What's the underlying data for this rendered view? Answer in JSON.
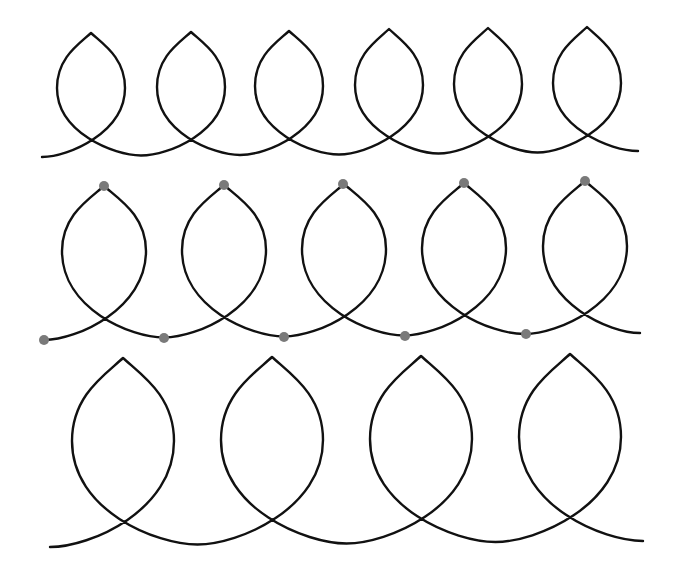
{
  "figure": {
    "stroke_color": "#111111",
    "dot_color": "#7a7a7a",
    "background": "#ffffff"
  },
  "rows": [
    {
      "id": "row-1",
      "start": [
        42,
        157
      ],
      "end": [
        638,
        151
      ],
      "loops": [
        {
          "cx": 91,
          "cusp_y": 33,
          "cross_y": 140,
          "wide_y": 88,
          "half_w": 34,
          "valley_y": 156
        },
        {
          "cx": 191,
          "cusp_y": 32,
          "cross_y": 140,
          "wide_y": 87,
          "half_w": 34,
          "valley_y": 155
        },
        {
          "cx": 289,
          "cusp_y": 31,
          "cross_y": 139,
          "wide_y": 86,
          "half_w": 34,
          "valley_y": 155
        },
        {
          "cx": 389,
          "cusp_y": 29,
          "cross_y": 137,
          "wide_y": 85,
          "half_w": 34,
          "valley_y": 154
        },
        {
          "cx": 488,
          "cusp_y": 28,
          "cross_y": 136,
          "wide_y": 84,
          "half_w": 34,
          "valley_y": 153
        },
        {
          "cx": 587,
          "cusp_y": 27,
          "cross_y": 135,
          "wide_y": 83,
          "half_w": 34,
          "valley_y": 152
        }
      ],
      "dots": []
    },
    {
      "id": "row-2",
      "start": [
        44,
        340
      ],
      "end": [
        640,
        333
      ],
      "loops": [
        {
          "cx": 104,
          "cusp_y": 186,
          "cross_y": 319,
          "wide_y": 251,
          "half_w": 42,
          "valley_y": 338
        },
        {
          "cx": 224,
          "cusp_y": 185,
          "cross_y": 318,
          "wide_y": 250,
          "half_w": 42,
          "valley_y": 337
        },
        {
          "cx": 344,
          "cusp_y": 184,
          "cross_y": 317,
          "wide_y": 249,
          "half_w": 42,
          "valley_y": 336
        },
        {
          "cx": 464,
          "cusp_y": 183,
          "cross_y": 316,
          "wide_y": 248,
          "half_w": 42,
          "valley_y": 335
        },
        {
          "cx": 585,
          "cusp_y": 181,
          "cross_y": 314,
          "wide_y": 246,
          "half_w": 42,
          "valley_y": 333
        }
      ],
      "dots": [
        [
          104,
          186
        ],
        [
          224,
          185
        ],
        [
          343,
          184
        ],
        [
          464,
          183
        ],
        [
          585,
          181
        ],
        [
          44,
          340
        ],
        [
          164,
          338
        ],
        [
          284,
          337
        ],
        [
          405,
          336
        ],
        [
          526,
          334
        ]
      ],
      "dot_radius": 5
    },
    {
      "id": "row-3",
      "start": [
        50,
        547
      ],
      "end": [
        643,
        541
      ],
      "loops": [
        {
          "cx": 123,
          "cusp_y": 358,
          "cross_y": 523,
          "wide_y": 441,
          "half_w": 51,
          "valley_y": 545
        },
        {
          "cx": 272,
          "cusp_y": 357,
          "cross_y": 521,
          "wide_y": 440,
          "half_w": 51,
          "valley_y": 544
        },
        {
          "cx": 421,
          "cusp_y": 356,
          "cross_y": 520,
          "wide_y": 439,
          "half_w": 51,
          "valley_y": 543
        },
        {
          "cx": 570,
          "cusp_y": 354,
          "cross_y": 518,
          "wide_y": 437,
          "half_w": 51,
          "valley_y": 541
        }
      ],
      "dots": []
    }
  ]
}
